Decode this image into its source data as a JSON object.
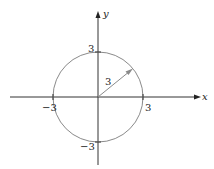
{
  "diagram": {
    "type": "circle-on-axes",
    "axes": {
      "x_label": "x",
      "y_label": "y"
    },
    "circle": {
      "center": [
        0,
        0
      ],
      "radius": 3
    },
    "radius_label": "3",
    "tick_labels": {
      "x_pos": "3",
      "x_neg": "−3",
      "y_pos": "3",
      "y_neg": "−3"
    },
    "colors": {
      "axes": "#333333",
      "circle": "#8a8a8a",
      "radius_arrow": "#8a8a8a"
    }
  }
}
